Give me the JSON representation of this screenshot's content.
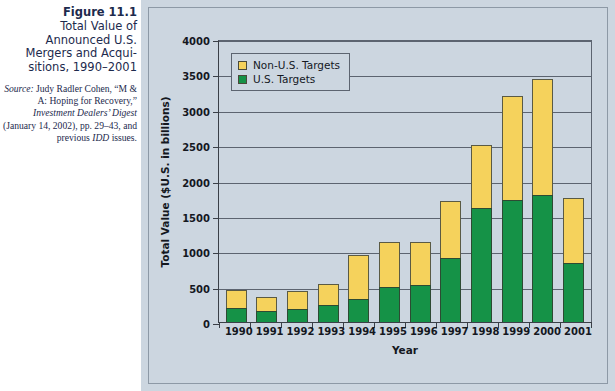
{
  "figure": {
    "number": "Figure 11.1",
    "title": "Total Value of Announced U.S. Mergers and Acqui­sitions, 1990–2001",
    "source_label": "Source:",
    "source_text": " Judy Radler Cohen, “M & A: Hoping for Recov­ery,” ",
    "source_italic_1": "Investment Dealers’ Digest",
    "source_text_2": " (January 14, 2002), pp. 29–43, and previous ",
    "source_italic_2": "IDD",
    "source_text_3": " issues."
  },
  "legend": {
    "position": "top-left-inside",
    "items": [
      {
        "label": "Non-U.S. Targets",
        "color": "#f5d25c",
        "icon": "legend-swatch-icon"
      },
      {
        "label": "U.S. Targets",
        "color": "#159247",
        "icon": "legend-swatch-icon"
      }
    ]
  },
  "colors": {
    "panel_background": "#ccd6e0",
    "non_us_targets": "#f5d25c",
    "us_targets": "#159247",
    "axis": "#3a3f47",
    "gridline": "#5c6470",
    "caption_text": "#1d2a4d"
  },
  "chart_data": {
    "type": "bar",
    "stacked": true,
    "xlabel": "Year",
    "ylabel": "Total Value ($U.S. in billions)",
    "ylim": [
      0,
      4000
    ],
    "yticks": [
      0,
      500,
      1000,
      1500,
      2000,
      2500,
      3000,
      3500,
      4000
    ],
    "ytick_labels": [
      "0",
      "500",
      "1000",
      "1500",
      "2000",
      "2500",
      "3000",
      "3500",
      "4000"
    ],
    "grid": true,
    "legend_position": "upper left",
    "categories": [
      "1990",
      "1991",
      "1992",
      "1993",
      "1994",
      "1995",
      "1996",
      "1997",
      "1998",
      "1999",
      "2000",
      "2001"
    ],
    "series": [
      {
        "name": "U.S. Targets",
        "color": "#159247",
        "values": [
          200,
          150,
          180,
          240,
          330,
          500,
          530,
          900,
          1610,
          1720,
          1800,
          840
        ]
      },
      {
        "name": "Non-U.S. Targets",
        "color": "#f5d25c",
        "values": [
          250,
          200,
          260,
          300,
          620,
          630,
          600,
          810,
          890,
          1470,
          1640,
          910
        ]
      }
    ],
    "totals": [
      450,
      350,
      440,
      540,
      950,
      1130,
      1130,
      1710,
      2500,
      3190,
      3440,
      1750
    ]
  }
}
